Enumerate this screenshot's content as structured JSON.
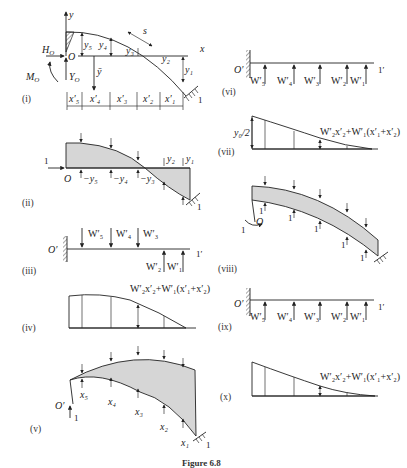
{
  "figure": {
    "caption": "Figure 6.8",
    "panels": {
      "i": {
        "label": "(i)",
        "axis_x": "x",
        "axis_y": "y",
        "origin": "O",
        "H": "H",
        "H_sub": "O",
        "M": "M",
        "M_sub": "O",
        "Y": "Y",
        "Y_sub": "O",
        "ybar": "ȳ",
        "s": "s",
        "y_labels": [
          "y₅",
          "y₄",
          "y₃",
          "y₂",
          "y₁"
        ],
        "x_labels": [
          "x′₅",
          "x′₄",
          "x′₃",
          "x′₂",
          "x′₁"
        ],
        "support": "1"
      },
      "ii": {
        "label": "(ii)",
        "origin": "O",
        "load": "1",
        "neg_labels": [
          "−y₅",
          "−y₄",
          "−y₃"
        ],
        "pos_labels": [
          "y₂",
          "y₁"
        ],
        "support": "1"
      },
      "iii": {
        "label": "(iii)",
        "origin": "O′",
        "end": "1′",
        "down_loads": [
          "W′₅",
          "W′₄",
          "W′₃"
        ],
        "up_loads": [
          "W′₂",
          "W′₁"
        ]
      },
      "iv": {
        "label": "(iv)",
        "formula": "W′₂x′₂+W′₁(x′₁+x′₂)"
      },
      "v": {
        "label": "(v)",
        "origin": "O′",
        "load": "1",
        "x_labels": [
          "x₅",
          "x₄",
          "x₃",
          "x₂",
          "x₁"
        ],
        "support": "1"
      },
      "vi": {
        "label": "(vi)",
        "origin": "O′",
        "end": "1′",
        "up_loads": [
          "W′₅",
          "W′₄",
          "W′₃",
          "W′₂",
          "W′₁"
        ]
      },
      "vii": {
        "label": "(vii)",
        "left_value": "y₀/2",
        "formula": "W′₂x′₂+W′₁(x′₁+x′₂)"
      },
      "viii": {
        "label": "(viii)",
        "origin": "O",
        "unit_loads": [
          "1",
          "1",
          "1",
          "1",
          "1",
          "1"
        ],
        "moment": "1"
      },
      "ix": {
        "label": "(ix)",
        "origin": "O′",
        "end": "1′",
        "up_loads": [
          "W′₅",
          "W′₄",
          "W′₃",
          "W′₂",
          "W′₁"
        ]
      },
      "x": {
        "label": "(x)",
        "formula": "W′₂x′₂+W′₁(x′₁+x′₂)"
      }
    }
  }
}
